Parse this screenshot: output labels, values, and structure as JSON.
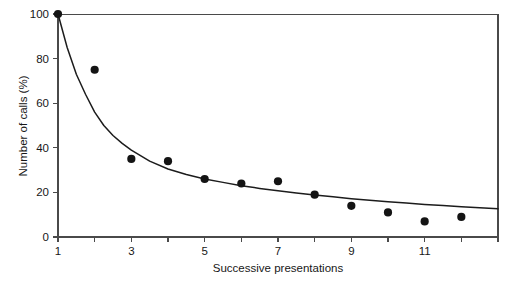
{
  "chart_data": {
    "type": "scatter",
    "title": "",
    "xlabel": "Successive presentations",
    "ylabel": "Number of calls (%)",
    "xlim": [
      1,
      13
    ],
    "ylim": [
      0,
      100
    ],
    "grid": false,
    "legend": "none",
    "x_ticks": [
      1,
      2,
      3,
      4,
      5,
      6,
      7,
      8,
      9,
      10,
      11,
      12,
      13
    ],
    "x_tick_labels": [
      "1",
      "",
      "3",
      "",
      "5",
      "",
      "7",
      "",
      "9",
      "",
      "11",
      "",
      ""
    ],
    "y_ticks": [
      0,
      20,
      40,
      60,
      80,
      100
    ],
    "y_tick_labels": [
      "0",
      "20",
      "40",
      "60",
      "80",
      "100"
    ],
    "series": [
      {
        "name": "Observed calls",
        "marker": "filled-circle",
        "color": "#141414",
        "x": [
          1,
          2,
          3,
          4,
          5,
          6,
          7,
          8,
          9,
          10,
          11,
          12
        ],
        "values": [
          100,
          75,
          35,
          34,
          26,
          24,
          25,
          19,
          14,
          11,
          7,
          9
        ]
      },
      {
        "name": "Fitted decay curve",
        "marker": "line",
        "color": "#1c1c1c",
        "x": [
          1,
          1.25,
          1.5,
          1.75,
          2,
          2.25,
          2.5,
          2.75,
          3,
          3.5,
          4,
          4.5,
          5,
          5.5,
          6,
          6.5,
          7,
          7.5,
          8,
          8.5,
          9,
          9.5,
          10,
          10.5,
          11,
          11.5,
          12,
          12.5,
          13
        ],
        "values": [
          100,
          85,
          73,
          64,
          56,
          50,
          45.5,
          42,
          39,
          34,
          30.5,
          28,
          26,
          24.5,
          23,
          21.8,
          20.7,
          19.7,
          18.8,
          18,
          17.2,
          16.5,
          15.8,
          15.2,
          14.6,
          14.1,
          13.6,
          13.1,
          12.7
        ]
      }
    ]
  }
}
